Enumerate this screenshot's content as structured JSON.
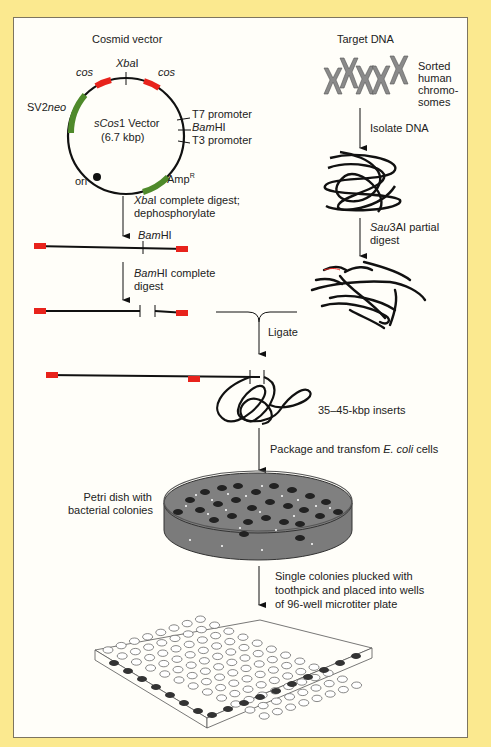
{
  "figure": {
    "colors": {
      "background": "#fbe98f",
      "panel": "#fffef9",
      "cos_site": "#e8231c",
      "gene_marker": "#4f8a2b",
      "dna": "#111111"
    },
    "vector": {
      "title": "Cosmid vector",
      "name_italic": "sCos",
      "name_rest": "1 Vector",
      "size": "(6.7 kbp)",
      "labels": {
        "xba_italic": "Xba",
        "xba_rest": "I",
        "cos_left": "cos",
        "cos_right": "cos",
        "sv2": "SV2",
        "neo": "neo",
        "t7": "T7 promoter",
        "bam_italic": "Bam",
        "bam_rest": "HI",
        "t3": "T3 promoter",
        "amp": "Amp",
        "amp_sup": "R",
        "ori": "ori"
      }
    },
    "target": {
      "title": "Target DNA",
      "chromosomes_label": [
        "Sorted",
        "human",
        "chromo-",
        "somes"
      ]
    },
    "steps": {
      "xba_digest_italic": "Xba",
      "xba_digest_rest": "I complete digest;",
      "xba_digest_line2": "dephosphorylate",
      "bam_site_italic": "Bam",
      "bam_site_rest": "HI",
      "bam_digest_italic": "Bam",
      "bam_digest_rest": "HI complete",
      "bam_digest_line2": "digest",
      "isolate": "Isolate DNA",
      "sau_italic": "Sau",
      "sau_rest": "3AI partial",
      "sau_line2": "digest",
      "ligate": "Ligate",
      "inserts": "35–45-kbp inserts",
      "package_pre": "Package and transfom ",
      "package_italic": "E. coli",
      "package_post": " cells",
      "petri": [
        "Petri dish with",
        "bacterial colonies"
      ],
      "pluck": [
        "Single colonies plucked with",
        "toothpick and placed into wells",
        "of 96-well microtiter plate"
      ]
    }
  }
}
